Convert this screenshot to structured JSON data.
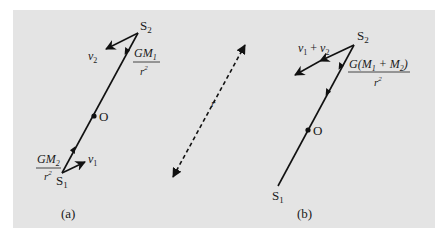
{
  "figure": {
    "background_color": "#e4e4e4",
    "ink_color": "#111111",
    "panel_a": {
      "caption": "(a)",
      "star_top": {
        "name": "S",
        "sub": "2"
      },
      "star_bottom": {
        "name": "S",
        "sub": "1"
      },
      "center": "O",
      "velocity_top": {
        "name": "v",
        "sub": "2"
      },
      "velocity_bottom": {
        "name": "v",
        "sub": "1"
      },
      "accel_top": {
        "numerator_pre": "GM",
        "numerator_sub": "1",
        "denominator": "r",
        "denominator_sup": "2"
      },
      "accel_bottom": {
        "numerator_pre": "GM",
        "numerator_sub": "2",
        "denominator": "r",
        "denominator_sup": "2"
      }
    },
    "separation": {
      "label": "r",
      "style": "dashed",
      "arrows": "both"
    },
    "panel_b": {
      "caption": "(b)",
      "star_top": {
        "name": "S",
        "sub": "2"
      },
      "star_bottom": {
        "name": "S",
        "sub": "1"
      },
      "center": "O",
      "velocity": {
        "a": "v",
        "a_sub": "1",
        "op": " + ",
        "b": "v",
        "b_sub": "2"
      },
      "accel": {
        "pre": "G(M",
        "sub1": "1",
        "mid": " + M",
        "sub2": "2",
        "post": ")",
        "denominator": "r",
        "denominator_sup": "2"
      }
    }
  }
}
